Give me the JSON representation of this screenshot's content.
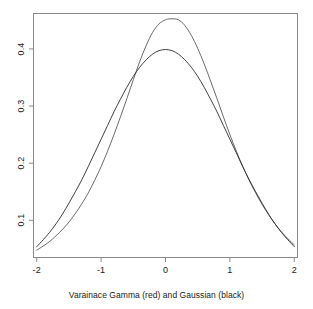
{
  "figure": {
    "background_color": "#ffffff",
    "box_color": "#808080",
    "caption": "Varainace Gamma (red) and Gaussian (black)"
  },
  "axes": {
    "x_tick_labels": [
      "-2",
      "-1",
      "0",
      "1",
      "2"
    ],
    "y_tick_labels": [
      "0.1",
      "0.2",
      "0.3",
      "0.4"
    ]
  },
  "chart_data": {
    "type": "line",
    "title": "",
    "subtitle": "",
    "xlabel": "Varainace Gamma (red) and Gaussian (black)",
    "ylabel": "",
    "xlim": [
      -2.05,
      2.05
    ],
    "ylim": [
      0.035,
      0.462
    ],
    "xticks": [
      -2,
      -1,
      0,
      1,
      2
    ],
    "yticks": [
      0.1,
      0.2,
      0.3,
      0.4
    ],
    "grid": false,
    "legend": "none",
    "box": true,
    "annotations": [
      "Variance Gamma density peaks near 0.45 at x = 0.15",
      "Gaussian density peaks at 0.399 at x = 0",
      "Curves cross near x = -0.35 and x = 0.85",
      "Both tails converge near y = 0.048 at x = -2 and x = 2"
    ],
    "series": [
      {
        "name": "Varainace Gamma (red)",
        "color": "#5a5a5a",
        "x": [
          -2.0,
          -1.9,
          -1.8,
          -1.7,
          -1.6,
          -1.5,
          -1.4,
          -1.3,
          -1.2,
          -1.1,
          -1.0,
          -0.9,
          -0.8,
          -0.7,
          -0.6,
          -0.5,
          -0.4,
          -0.3,
          -0.2,
          -0.1,
          0.0,
          0.05,
          0.1,
          0.15,
          0.2,
          0.25,
          0.3,
          0.4,
          0.5,
          0.6,
          0.7,
          0.8,
          0.9,
          1.0,
          1.1,
          1.2,
          1.3,
          1.4,
          1.5,
          1.6,
          1.7,
          1.8,
          1.9,
          2.0
        ],
        "values": [
          0.048,
          0.055,
          0.063,
          0.073,
          0.084,
          0.097,
          0.112,
          0.129,
          0.148,
          0.17,
          0.194,
          0.221,
          0.25,
          0.281,
          0.313,
          0.346,
          0.378,
          0.406,
          0.429,
          0.444,
          0.451,
          0.4525,
          0.4528,
          0.4525,
          0.451,
          0.447,
          0.441,
          0.424,
          0.401,
          0.374,
          0.344,
          0.313,
          0.281,
          0.25,
          0.221,
          0.194,
          0.17,
          0.148,
          0.128,
          0.11,
          0.094,
          0.08,
          0.068,
          0.057
        ]
      },
      {
        "name": "Gaussian (black)",
        "color": "#2b2b2b",
        "x": [
          -2.0,
          -1.9,
          -1.8,
          -1.7,
          -1.6,
          -1.5,
          -1.4,
          -1.3,
          -1.2,
          -1.1,
          -1.0,
          -0.9,
          -0.8,
          -0.7,
          -0.6,
          -0.5,
          -0.4,
          -0.3,
          -0.2,
          -0.1,
          0.0,
          0.1,
          0.2,
          0.3,
          0.4,
          0.5,
          0.6,
          0.7,
          0.8,
          0.9,
          1.0,
          1.1,
          1.2,
          1.3,
          1.4,
          1.5,
          1.6,
          1.7,
          1.8,
          1.9,
          2.0
        ],
        "values": [
          0.054,
          0.066,
          0.079,
          0.094,
          0.111,
          0.13,
          0.15,
          0.171,
          0.194,
          0.218,
          0.242,
          0.266,
          0.29,
          0.312,
          0.333,
          0.352,
          0.368,
          0.381,
          0.391,
          0.397,
          0.399,
          0.397,
          0.391,
          0.381,
          0.368,
          0.352,
          0.333,
          0.312,
          0.29,
          0.266,
          0.242,
          0.218,
          0.194,
          0.171,
          0.15,
          0.13,
          0.111,
          0.094,
          0.079,
          0.066,
          0.054
        ]
      }
    ]
  }
}
